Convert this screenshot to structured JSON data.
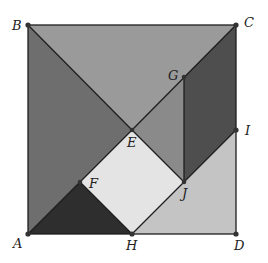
{
  "diagram": {
    "points": {
      "A": {
        "label": "A",
        "x": 28,
        "y": 234
      },
      "B": {
        "label": "B",
        "x": 28,
        "y": 25
      },
      "C": {
        "label": "C",
        "x": 236,
        "y": 25
      },
      "D": {
        "label": "D",
        "x": 236,
        "y": 234
      },
      "E": {
        "label": "E",
        "x": 132,
        "y": 130
      },
      "F": {
        "label": "F",
        "x": 80,
        "y": 182
      },
      "G": {
        "label": "G",
        "x": 184,
        "y": 77
      },
      "H": {
        "label": "H",
        "x": 132,
        "y": 234
      },
      "I": {
        "label": "I",
        "x": 236,
        "y": 130
      },
      "J": {
        "label": "J",
        "x": 184,
        "y": 182
      }
    },
    "regions": [
      {
        "name": "triangle-BCE",
        "vertices": [
          "B",
          "C",
          "E"
        ],
        "color": "#9a9a9a"
      },
      {
        "name": "triangle-ABE",
        "vertices": [
          "A",
          "B",
          "E"
        ],
        "color": "#6e6e6e"
      },
      {
        "name": "triangle-EGJ",
        "vertices": [
          "E",
          "G",
          "J"
        ],
        "color": "#8a8a8a"
      },
      {
        "name": "parallelogram-GCIJ",
        "vertices": [
          "G",
          "C",
          "I",
          "J"
        ],
        "color": "#4e4e4e"
      },
      {
        "name": "square-EJHF",
        "vertices": [
          "E",
          "J",
          "H",
          "F"
        ],
        "color": "#e4e4e4"
      },
      {
        "name": "triangle-AFH",
        "vertices": [
          "A",
          "F",
          "H"
        ],
        "color": "#2e2e2e"
      },
      {
        "name": "quad-HJID",
        "vertices": [
          "H",
          "J",
          "I",
          "D"
        ],
        "color": "#c4c4c4"
      }
    ]
  }
}
